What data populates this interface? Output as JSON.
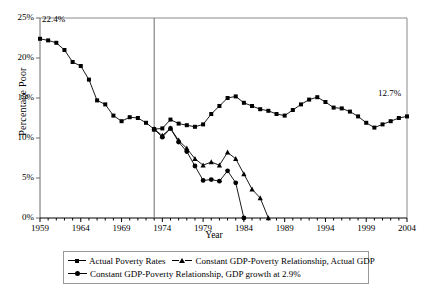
{
  "chart_data": {
    "type": "line",
    "title": "",
    "xlabel": "Year",
    "ylabel": "Percentage Poor",
    "xlim": [
      1959,
      2004
    ],
    "ylim": [
      0,
      25
    ],
    "ytick_labels": [
      "0%",
      "5%",
      "10%",
      "15%",
      "20%",
      "25%"
    ],
    "ytick_values": [
      0,
      5,
      10,
      15,
      20,
      25
    ],
    "xtick_labels": [
      "1959",
      "1964",
      "1969",
      "1974",
      "1979",
      "1984",
      "1989",
      "1994",
      "1999",
      "2004"
    ],
    "xtick_values": [
      1959,
      1964,
      1969,
      1974,
      1979,
      1984,
      1989,
      1994,
      1999,
      2004
    ],
    "grid": false,
    "legend_position": "below",
    "annotations": [
      {
        "text": "22.4%",
        "x": 1960,
        "y": 24.0
      },
      {
        "text": "12.7%",
        "x": 2000,
        "y": 14.6
      }
    ],
    "reference_lines": [
      {
        "orientation": "vertical",
        "x": 1973
      }
    ],
    "series": [
      {
        "name": "Actual Poverty Rates",
        "marker": "square",
        "x": [
          1959,
          1960,
          1961,
          1962,
          1963,
          1964,
          1965,
          1966,
          1967,
          1968,
          1969,
          1970,
          1971,
          1972,
          1973,
          1974,
          1975,
          1976,
          1977,
          1978,
          1979,
          1980,
          1981,
          1982,
          1983,
          1984,
          1985,
          1986,
          1987,
          1988,
          1989,
          1990,
          1991,
          1992,
          1993,
          1994,
          1995,
          1996,
          1997,
          1998,
          1999,
          2000,
          2001,
          2002,
          2003,
          2004
        ],
        "values": [
          22.4,
          22.2,
          21.9,
          21.0,
          19.5,
          19.0,
          17.3,
          14.7,
          14.2,
          12.8,
          12.1,
          12.6,
          12.5,
          11.9,
          11.1,
          11.2,
          12.3,
          11.8,
          11.6,
          11.4,
          11.7,
          13.0,
          14.0,
          15.0,
          15.2,
          14.4,
          14.0,
          13.6,
          13.4,
          13.0,
          12.8,
          13.5,
          14.2,
          14.8,
          15.1,
          14.5,
          13.8,
          13.7,
          13.3,
          12.7,
          11.9,
          11.3,
          11.7,
          12.1,
          12.5,
          12.7
        ]
      },
      {
        "name": "Constant GDP-Poverty Relationship, Actual GDP",
        "marker": "triangle",
        "x": [
          1973,
          1974,
          1975,
          1976,
          1977,
          1978,
          1979,
          1980,
          1981,
          1982,
          1983,
          1984,
          1985,
          1986,
          1987
        ],
        "values": [
          11.1,
          10.3,
          11.2,
          9.7,
          8.7,
          7.4,
          6.6,
          7.0,
          6.6,
          8.2,
          7.4,
          5.5,
          3.6,
          2.5,
          0.0
        ]
      },
      {
        "name": "Constant GDP-Poverty Relationship, GDP growth at 2.9%",
        "marker": "circle",
        "x": [
          1973,
          1974,
          1975,
          1976,
          1977,
          1978,
          1979,
          1980,
          1981,
          1982,
          1983,
          1984
        ],
        "values": [
          11.1,
          10.1,
          11.2,
          9.5,
          8.3,
          6.5,
          4.7,
          4.8,
          4.6,
          5.9,
          4.4,
          0.0
        ]
      }
    ]
  },
  "legend": {
    "items": [
      {
        "label": "Actual Poverty Rates",
        "marker": "square-marker-icon"
      },
      {
        "label": "Constant GDP-Poverty Relationship, Actual GDP",
        "marker": "triangle-marker-icon"
      },
      {
        "label": "Constant GDP-Poverty Relationship, GDP growth at 2.9%",
        "marker": "circle-marker-icon"
      }
    ]
  }
}
